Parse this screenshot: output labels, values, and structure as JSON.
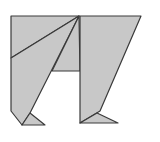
{
  "diagram": {
    "type": "tangram-figure",
    "fill_color": "#c8c8c8",
    "stroke_color": "#3a3a3a",
    "background": "#ffffff",
    "pieces": [
      {
        "name": "top-left-triangle",
        "points": "11,16 79,16 11,58"
      },
      {
        "name": "left-large-piece",
        "points": "11,58 79,16 30,113 22,125 11,111"
      },
      {
        "name": "left-foot-triangle",
        "points": "22,125 30,113 45,125"
      },
      {
        "name": "center-triangle",
        "points": "79,16 80,71 52,71"
      },
      {
        "name": "right-large-piece",
        "points": "80,16 141,16 100,111 80,123"
      },
      {
        "name": "right-foot-triangle",
        "points": "80,123 97,113 118,123"
      }
    ]
  }
}
